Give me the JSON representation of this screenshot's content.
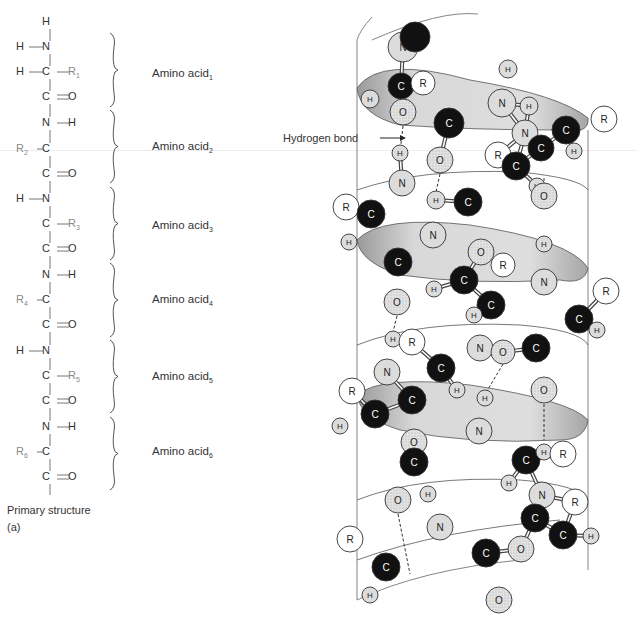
{
  "primary_structure": {
    "caption": "Primary structure",
    "panel_label": "(a)",
    "backbone_atoms": [
      {
        "text": "H",
        "x": 46,
        "y": 22
      },
      {
        "text": "H",
        "x": 20,
        "y": 47
      },
      {
        "text": "N",
        "x": 46,
        "y": 47
      },
      {
        "text": "H",
        "x": 20,
        "y": 72
      },
      {
        "text": "C",
        "x": 46,
        "y": 72
      },
      {
        "text": "R",
        "sub": "1",
        "x": 72,
        "y": 72,
        "r": true
      },
      {
        "text": "C",
        "x": 46,
        "y": 97
      },
      {
        "text": "O",
        "x": 72,
        "y": 97
      },
      {
        "text": "N",
        "x": 46,
        "y": 123
      },
      {
        "text": "H",
        "x": 72,
        "y": 123
      },
      {
        "text": "R",
        "sub": "2",
        "x": 20,
        "y": 149,
        "r": true
      },
      {
        "text": "C",
        "x": 46,
        "y": 149
      },
      {
        "text": "C",
        "x": 46,
        "y": 174
      },
      {
        "text": "O",
        "x": 72,
        "y": 174
      },
      {
        "text": "H",
        "x": 20,
        "y": 199
      },
      {
        "text": "N",
        "x": 46,
        "y": 199
      },
      {
        "text": "C",
        "x": 46,
        "y": 224
      },
      {
        "text": "R",
        "sub": "3",
        "x": 72,
        "y": 224,
        "r": true
      },
      {
        "text": "C",
        "x": 46,
        "y": 249
      },
      {
        "text": "O",
        "x": 72,
        "y": 249
      },
      {
        "text": "N",
        "x": 46,
        "y": 275
      },
      {
        "text": "H",
        "x": 72,
        "y": 275
      },
      {
        "text": "R",
        "sub": "4",
        "x": 20,
        "y": 300,
        "r": true
      },
      {
        "text": "C",
        "x": 46,
        "y": 300
      },
      {
        "text": "C",
        "x": 46,
        "y": 325
      },
      {
        "text": "O",
        "x": 72,
        "y": 325
      },
      {
        "text": "H",
        "x": 20,
        "y": 351
      },
      {
        "text": "N",
        "x": 46,
        "y": 351
      },
      {
        "text": "C",
        "x": 46,
        "y": 376
      },
      {
        "text": "R",
        "sub": "5",
        "x": 72,
        "y": 376,
        "r": true
      },
      {
        "text": "C",
        "x": 46,
        "y": 401
      },
      {
        "text": "O",
        "x": 72,
        "y": 401
      },
      {
        "text": "N",
        "x": 46,
        "y": 427
      },
      {
        "text": "H",
        "x": 72,
        "y": 427
      },
      {
        "text": "R",
        "sub": "6",
        "x": 20,
        "y": 452,
        "r": true
      },
      {
        "text": "C",
        "x": 46,
        "y": 452
      },
      {
        "text": "C",
        "x": 46,
        "y": 477
      },
      {
        "text": "O",
        "x": 72,
        "y": 477
      }
    ],
    "amino_acids": [
      {
        "label": "Amino acid",
        "sub": "1",
        "y": 74,
        "brace": [
          33,
          107
        ]
      },
      {
        "label": "Amino acid",
        "sub": "2",
        "y": 147,
        "brace": [
          110,
          183
        ]
      },
      {
        "label": "Amino acid",
        "sub": "3",
        "y": 226,
        "brace": [
          187,
          260
        ]
      },
      {
        "label": "Amino acid",
        "sub": "4",
        "y": 300,
        "brace": [
          263,
          337
        ]
      },
      {
        "label": "Amino acid",
        "sub": "5",
        "y": 377,
        "brace": [
          340,
          413
        ]
      },
      {
        "label": "Amino acid",
        "sub": "6",
        "y": 452,
        "brace": [
          417,
          490
        ]
      }
    ]
  },
  "helix": {
    "annotation": "Hydrogen bond",
    "colors": {
      "carbon": "#111111",
      "nitrogen": "#dcdcdc",
      "oxygen": "#d4d4d4",
      "hydrogen": "#d8d8d8",
      "r_group": "#ffffff",
      "ribbon": "#d6d6d6",
      "outline": "#333333"
    },
    "atoms": [
      {
        "e": "N",
        "x": 403,
        "y": 47,
        "r": 15
      },
      {
        "e": "top",
        "x": 415,
        "y": 37,
        "r": 15
      },
      {
        "e": "C",
        "x": 401,
        "y": 86,
        "r": 13
      },
      {
        "e": "R",
        "x": 423,
        "y": 83,
        "r": 12
      },
      {
        "e": "H",
        "x": 370,
        "y": 99,
        "r": 9
      },
      {
        "e": "O",
        "x": 403,
        "y": 112,
        "r": 13
      },
      {
        "e": "C",
        "x": 449,
        "y": 123,
        "r": 15
      },
      {
        "e": "H",
        "x": 508,
        "y": 69,
        "r": 9
      },
      {
        "e": "N",
        "x": 502,
        "y": 103,
        "r": 14
      },
      {
        "e": "H",
        "x": 529,
        "y": 106,
        "r": 9
      },
      {
        "e": "C",
        "x": 566,
        "y": 130,
        "r": 14
      },
      {
        "e": "R",
        "x": 604,
        "y": 119,
        "r": 13
      },
      {
        "e": "H",
        "x": 574,
        "y": 151,
        "r": 8
      },
      {
        "e": "N",
        "x": 525,
        "y": 133,
        "r": 13
      },
      {
        "e": "C",
        "x": 541,
        "y": 148,
        "r": 13
      },
      {
        "e": "R",
        "x": 498,
        "y": 155,
        "r": 13
      },
      {
        "e": "C",
        "x": 516,
        "y": 166,
        "r": 14
      },
      {
        "e": "H",
        "x": 400,
        "y": 153,
        "r": 8
      },
      {
        "e": "O",
        "x": 440,
        "y": 160,
        "r": 13
      },
      {
        "e": "N",
        "x": 402,
        "y": 183,
        "r": 13
      },
      {
        "e": "H",
        "x": 436,
        "y": 200,
        "r": 9
      },
      {
        "e": "C",
        "x": 468,
        "y": 202,
        "r": 14
      },
      {
        "e": "H",
        "x": 537,
        "y": 186,
        "r": 8
      },
      {
        "e": "O",
        "x": 544,
        "y": 196,
        "r": 13
      },
      {
        "e": "R",
        "x": 346,
        "y": 207,
        "r": 13
      },
      {
        "e": "C",
        "x": 371,
        "y": 214,
        "r": 14
      },
      {
        "e": "H",
        "x": 349,
        "y": 242,
        "r": 8
      },
      {
        "e": "N",
        "x": 433,
        "y": 235,
        "r": 13
      },
      {
        "e": "O",
        "x": 481,
        "y": 252,
        "r": 13
      },
      {
        "e": "R",
        "x": 503,
        "y": 265,
        "r": 12
      },
      {
        "e": "H",
        "x": 544,
        "y": 244,
        "r": 8
      },
      {
        "e": "C",
        "x": 398,
        "y": 262,
        "r": 14
      },
      {
        "e": "C",
        "x": 464,
        "y": 280,
        "r": 14
      },
      {
        "e": "H",
        "x": 434,
        "y": 289,
        "r": 8
      },
      {
        "e": "N",
        "x": 544,
        "y": 282,
        "r": 13
      },
      {
        "e": "R",
        "x": 606,
        "y": 291,
        "r": 13
      },
      {
        "e": "C",
        "x": 491,
        "y": 305,
        "r": 14
      },
      {
        "e": "H",
        "x": 474,
        "y": 315,
        "r": 8
      },
      {
        "e": "C",
        "x": 579,
        "y": 319,
        "r": 14
      },
      {
        "e": "H",
        "x": 597,
        "y": 330,
        "r": 8
      },
      {
        "e": "O",
        "x": 397,
        "y": 302,
        "r": 13
      },
      {
        "e": "H",
        "x": 393,
        "y": 339,
        "r": 8
      },
      {
        "e": "R",
        "x": 412,
        "y": 342,
        "r": 13
      },
      {
        "e": "N",
        "x": 480,
        "y": 348,
        "r": 13
      },
      {
        "e": "O",
        "x": 503,
        "y": 352,
        "r": 12
      },
      {
        "e": "C",
        "x": 536,
        "y": 348,
        "r": 14
      },
      {
        "e": "N",
        "x": 387,
        "y": 372,
        "r": 13
      },
      {
        "e": "C",
        "x": 441,
        "y": 368,
        "r": 14
      },
      {
        "e": "H",
        "x": 457,
        "y": 390,
        "r": 8
      },
      {
        "e": "C",
        "x": 412,
        "y": 400,
        "r": 14
      },
      {
        "e": "R",
        "x": 352,
        "y": 391,
        "r": 13
      },
      {
        "e": "O",
        "x": 544,
        "y": 390,
        "r": 13
      },
      {
        "e": "C",
        "x": 375,
        "y": 414,
        "r": 14
      },
      {
        "e": "H",
        "x": 340,
        "y": 426,
        "r": 8
      },
      {
        "e": "H",
        "x": 485,
        "y": 398,
        "r": 8
      },
      {
        "e": "N",
        "x": 479,
        "y": 431,
        "r": 13
      },
      {
        "e": "O",
        "x": 414,
        "y": 442,
        "r": 13
      },
      {
        "e": "C",
        "x": 414,
        "y": 462,
        "r": 14
      },
      {
        "e": "C",
        "x": 526,
        "y": 460,
        "r": 14
      },
      {
        "e": "H",
        "x": 544,
        "y": 452,
        "r": 8
      },
      {
        "e": "R",
        "x": 563,
        "y": 454,
        "r": 13
      },
      {
        "e": "H",
        "x": 509,
        "y": 483,
        "r": 8
      },
      {
        "e": "O",
        "x": 398,
        "y": 500,
        "r": 13
      },
      {
        "e": "H",
        "x": 428,
        "y": 494,
        "r": 8
      },
      {
        "e": "N",
        "x": 542,
        "y": 495,
        "r": 13
      },
      {
        "e": "R",
        "x": 575,
        "y": 502,
        "r": 13
      },
      {
        "e": "C",
        "x": 535,
        "y": 518,
        "r": 14
      },
      {
        "e": "N",
        "x": 440,
        "y": 527,
        "r": 13
      },
      {
        "e": "C",
        "x": 563,
        "y": 535,
        "r": 14
      },
      {
        "e": "H",
        "x": 591,
        "y": 536,
        "r": 8
      },
      {
        "e": "O",
        "x": 521,
        "y": 549,
        "r": 13
      },
      {
        "e": "R",
        "x": 350,
        "y": 539,
        "r": 13
      },
      {
        "e": "C",
        "x": 486,
        "y": 553,
        "r": 14
      },
      {
        "e": "C",
        "x": 386,
        "y": 567,
        "r": 14
      },
      {
        "e": "H",
        "x": 370,
        "y": 595,
        "r": 8
      },
      {
        "e": "O",
        "x": 499,
        "y": 600,
        "r": 13
      }
    ],
    "hbonds": [
      [
        403,
        126,
        401,
        144
      ],
      [
        440,
        174,
        436,
        192
      ],
      [
        544,
        178,
        544,
        209
      ],
      [
        397,
        316,
        393,
        332
      ],
      [
        544,
        236,
        544,
        236
      ],
      [
        481,
        266,
        481,
        266
      ],
      [
        503,
        364,
        487,
        391
      ],
      [
        544,
        404,
        544,
        440
      ],
      [
        414,
        456,
        414,
        456
      ],
      [
        398,
        514,
        410,
        574
      ]
    ]
  }
}
